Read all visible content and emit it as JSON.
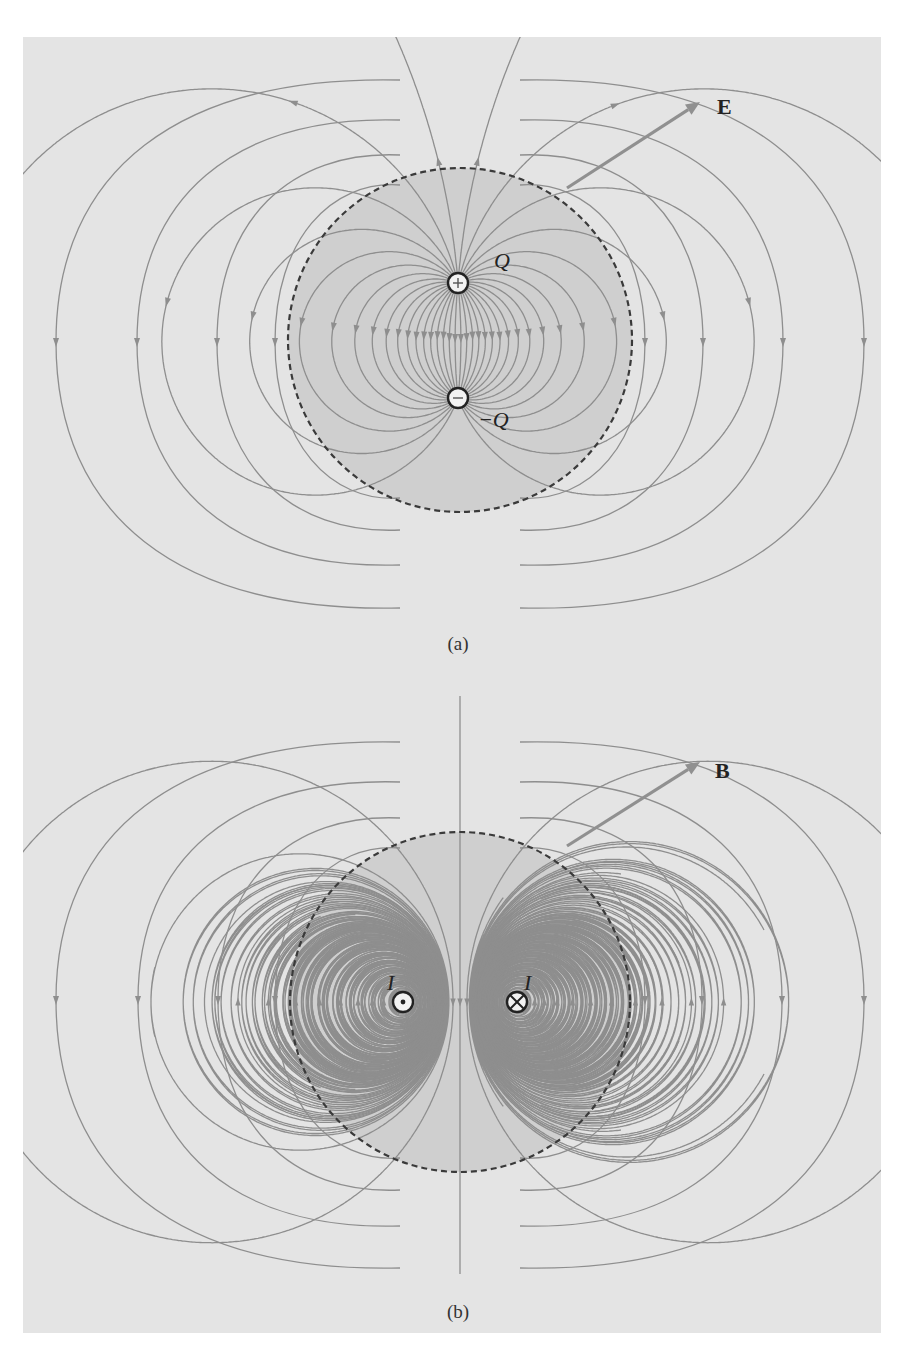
{
  "figure": {
    "panel": {
      "x": 23,
      "y": 37,
      "width": 858,
      "height": 1296,
      "background": "#e4e4e4"
    },
    "colors": {
      "panel_bg": "#e4e4e4",
      "shaded_region": "#cfcfcf",
      "field_line": "#8e8e8e",
      "boundary_dash": "#3a3a3a",
      "vector_arrow": "#909090",
      "text": "#222222"
    }
  },
  "panel_a": {
    "caption": "(a)",
    "caption_pos": [
      458,
      650
    ],
    "field_name": "E",
    "field_label_pos": [
      717,
      114
    ],
    "field_arrow": {
      "from": [
        567,
        188
      ],
      "to": [
        700,
        102
      ]
    },
    "region": {
      "cx": 460,
      "cy": 340,
      "r": 172
    },
    "charges": [
      {
        "name": "positive-charge",
        "sign": "+",
        "label": "Q",
        "x": 458,
        "y": 283,
        "label_pos": [
          494,
          268
        ]
      },
      {
        "name": "negative-charge",
        "sign": "−",
        "label": "−Q",
        "x": 458,
        "y": 398,
        "label_pos": [
          478,
          427
        ]
      }
    ],
    "outer_loops": [
      {
        "half_w": 404,
        "top": 80,
        "bottom": 608,
        "arrow_y": 342
      },
      {
        "half_w": 323,
        "top": 120,
        "bottom": 565,
        "arrow_y": 342
      },
      {
        "half_w": 243,
        "top": 155,
        "bottom": 530,
        "arrow_y": 342
      },
      {
        "half_w": 185,
        "top": 185,
        "bottom": 498,
        "arrow_y": 342
      }
    ],
    "description": "Electric field lines of an electric dipole: charge Q above, charge -Q below; shaded circular region bounded by dashed circle; field vector E drawn tangent to a field line outside the region."
  },
  "panel_b": {
    "caption": "(b)",
    "caption_pos": [
      458,
      1318
    ],
    "field_name": "B",
    "field_label_pos": [
      715,
      778
    ],
    "field_arrow": {
      "from": [
        567,
        846
      ],
      "to": [
        700,
        762
      ]
    },
    "region": {
      "cx": 460,
      "cy": 1002,
      "r": 170
    },
    "currents": [
      {
        "name": "current-out-of-page",
        "symbol": "dot",
        "label": "I",
        "x": 403,
        "y": 1002,
        "label_pos": [
          387,
          990
        ]
      },
      {
        "name": "current-into-page",
        "symbol": "cross",
        "label": "I",
        "x": 517,
        "y": 1002,
        "label_pos": [
          524,
          990
        ]
      }
    ],
    "outer_loops": [
      {
        "half_w": 404,
        "top": 742,
        "bottom": 1268,
        "arrow_y": 1000
      },
      {
        "half_w": 322,
        "top": 782,
        "bottom": 1226,
        "arrow_y": 1000
      },
      {
        "half_w": 242,
        "top": 818,
        "bottom": 1190,
        "arrow_y": 1000
      },
      {
        "half_w": 185,
        "top": 848,
        "bottom": 1158,
        "arrow_y": 1000
      }
    ],
    "description": "Magnetic field lines of a current loop cross-section: current I out of page (dot) on left, current I into page (cross) on right; shaded circular region bounded by dashed circle; field vector B tangent to a field line outside."
  }
}
